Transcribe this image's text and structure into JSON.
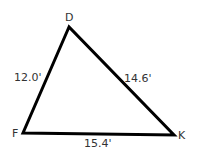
{
  "diagram": {
    "type": "triangle",
    "vertices": [
      {
        "name": "D",
        "x": 69,
        "y": 27,
        "label_x": 66,
        "label_y": 21
      },
      {
        "name": "F",
        "x": 23,
        "y": 133,
        "label_x": 12,
        "label_y": 137
      },
      {
        "name": "K",
        "x": 174,
        "y": 135,
        "label_x": 178,
        "label_y": 139
      }
    ],
    "sides": [
      {
        "from": "D",
        "to": "F",
        "length": "12.0'",
        "label_x": 14,
        "label_y": 81
      },
      {
        "from": "D",
        "to": "K",
        "length": "14.6'",
        "label_x": 124,
        "label_y": 82
      },
      {
        "from": "F",
        "to": "K",
        "length": "15.4'",
        "label_x": 84,
        "label_y": 146
      }
    ],
    "stroke_color": "#000000",
    "label_color": "#333333"
  }
}
